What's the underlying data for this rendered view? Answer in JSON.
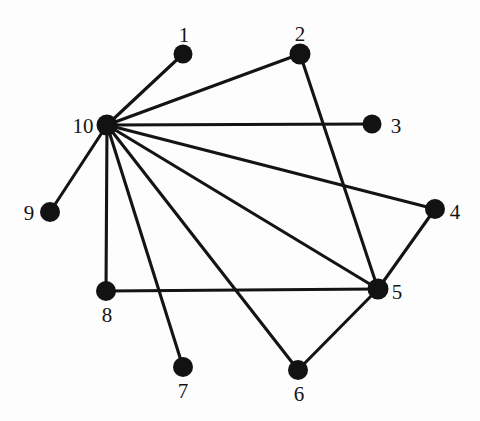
{
  "figure": {
    "type": "graph-diagram",
    "title": "",
    "background_color": "#fdfdfd",
    "node_color": "#121212",
    "edge_color": "#141414",
    "width": 480,
    "height": 421
  },
  "graph": {
    "node_count": 10,
    "edge_count": 13,
    "nodes": [
      {
        "id": "1",
        "label": "1",
        "x": 183,
        "y": 54,
        "r": 9.5,
        "label_x": 184,
        "label_y": 35
      },
      {
        "id": "2",
        "label": "2",
        "x": 300,
        "y": 54,
        "r": 10.5,
        "label_x": 300,
        "label_y": 34
      },
      {
        "id": "3",
        "label": "3",
        "x": 372,
        "y": 124,
        "r": 9.5,
        "label_x": 396,
        "label_y": 126
      },
      {
        "id": "4",
        "label": "4",
        "x": 435,
        "y": 209,
        "r": 10.0,
        "label_x": 455,
        "label_y": 212
      },
      {
        "id": "5",
        "label": "5",
        "x": 378,
        "y": 289,
        "r": 10.5,
        "label_x": 397,
        "label_y": 292
      },
      {
        "id": "6",
        "label": "6",
        "x": 298,
        "y": 370,
        "r": 10.0,
        "label_x": 299,
        "label_y": 394
      },
      {
        "id": "7",
        "label": "7",
        "x": 183,
        "y": 367,
        "r": 10.0,
        "label_x": 183,
        "label_y": 391
      },
      {
        "id": "8",
        "label": "8",
        "x": 106,
        "y": 291,
        "r": 10.0,
        "label_x": 107,
        "label_y": 315
      },
      {
        "id": "9",
        "label": "9",
        "x": 50,
        "y": 212,
        "r": 10.0,
        "label_x": 29,
        "label_y": 213
      },
      {
        "id": "10",
        "label": "10",
        "x": 107,
        "y": 125,
        "r": 10.5,
        "label_x": 83,
        "label_y": 126
      }
    ],
    "edges": [
      {
        "source": "10",
        "target": "1"
      },
      {
        "source": "10",
        "target": "2"
      },
      {
        "source": "10",
        "target": "3"
      },
      {
        "source": "10",
        "target": "4"
      },
      {
        "source": "10",
        "target": "5"
      },
      {
        "source": "10",
        "target": "6"
      },
      {
        "source": "10",
        "target": "7"
      },
      {
        "source": "10",
        "target": "8"
      },
      {
        "source": "10",
        "target": "9"
      },
      {
        "source": "2",
        "target": "5"
      },
      {
        "source": "4",
        "target": "5"
      },
      {
        "source": "5",
        "target": "6"
      },
      {
        "source": "5",
        "target": "8"
      }
    ]
  }
}
